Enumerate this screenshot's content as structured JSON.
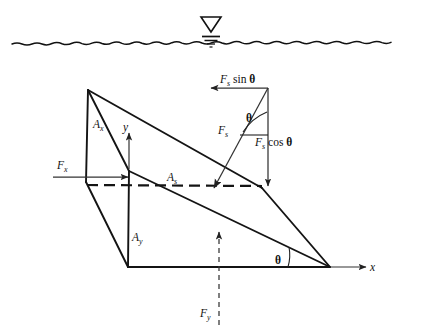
{
  "figure": {
    "background_color": "#ffffff",
    "line_color": "#141414"
  },
  "water_surface": {
    "symbol_name": "water-table-symbol",
    "description": "wavy free-surface line with inverted triangle water-table marker"
  },
  "labels": {
    "area_x": {
      "base": "A",
      "sub": "x"
    },
    "area_y": {
      "base": "A",
      "sub": "y"
    },
    "area_s": {
      "base": "A",
      "sub": "s"
    },
    "force_x": {
      "base": "F",
      "sub": "x"
    },
    "force_y": {
      "base": "F",
      "sub": "y"
    },
    "force_s": {
      "base": "F",
      "sub": "s"
    },
    "force_s_sin": {
      "base": "F",
      "sub": "s",
      "trail": " sin "
    },
    "force_s_cos": {
      "base": "F",
      "sub": "s",
      "trail": " cos "
    },
    "theta": "θ",
    "axis_x": "x",
    "axis_y": "y"
  },
  "axes": {
    "x_label": "x",
    "y_label": "y"
  },
  "angles": {
    "wedge_angle": "θ",
    "force_angle": "θ"
  }
}
